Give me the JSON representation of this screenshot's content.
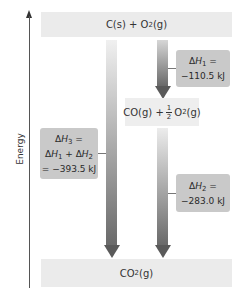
{
  "axis": {
    "label": "Energy"
  },
  "levels": {
    "top": {
      "species": "C(s) + O",
      "sub": "2",
      "tail": "(g)"
    },
    "middle": {
      "lead": "CO(g) +",
      "frac_num": "1",
      "frac_den": "2",
      "o": "O",
      "sub": "2",
      "tail": "(g)"
    },
    "bottom": {
      "lead": "CO",
      "sub": "2",
      "tail": "(g)"
    }
  },
  "steps": [
    {
      "id": "dh1",
      "delta": "Δ",
      "symbol": "H",
      "sub": "1",
      "eq": " =",
      "value": "−110.5 kJ"
    },
    {
      "id": "dh2",
      "delta": "Δ",
      "symbol": "H",
      "sub": "2",
      "eq": " =",
      "value": "−283.0 kJ"
    },
    {
      "id": "dh3",
      "delta": "Δ",
      "symbol": "H",
      "sub": "3",
      "eq": " =",
      "sum_a": "H",
      "sum_a_sub": "1",
      "plus": " + Δ",
      "sum_b": "H",
      "sum_b_sub": "2",
      "value": "= −393.5 kJ"
    }
  ],
  "colors": {
    "level_fill": "#ebebeb",
    "box_fill": "#c9c9c9",
    "arrow_dark": "#5a5a5a"
  }
}
